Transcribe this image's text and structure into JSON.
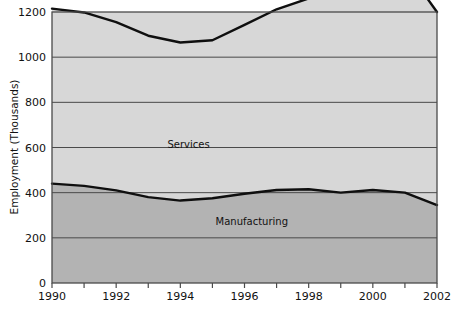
{
  "chart_data": {
    "type": "area",
    "title": "",
    "subtitle": "",
    "xlabel": "",
    "ylabel": "Employment (Thousands)",
    "xlim": [
      1990,
      2002
    ],
    "ylim": [
      0,
      1200
    ],
    "grid": true,
    "grid_axis": "y",
    "legend": "inline-annotations",
    "stacked": true,
    "x": [
      1990,
      1991,
      1992,
      1993,
      1994,
      1995,
      1996,
      1997,
      1998,
      1999,
      2000,
      2001,
      2002
    ],
    "x_tick_labels": [
      "1990",
      "1992",
      "1994",
      "1996",
      "1998",
      "2000",
      "2002"
    ],
    "x_tick_values": [
      1990,
      1992,
      1994,
      1996,
      1998,
      2000,
      2002
    ],
    "x_minor_tick_values": [
      1990,
      1991,
      1992,
      1993,
      1994,
      1995,
      1996,
      1997,
      1998,
      1999,
      2000,
      2001,
      2002
    ],
    "y_tick_labels": [
      "0",
      "200",
      "400",
      "600",
      "800",
      "1000",
      "1200"
    ],
    "y_tick_values": [
      0,
      200,
      400,
      600,
      800,
      1000,
      1200
    ],
    "series": [
      {
        "name": "Manufacturing",
        "label": "Manufacturing",
        "label_x": 1995.1,
        "label_y": 255,
        "fill": "#b3b3b3",
        "line": "#0f0f0f",
        "values": [
          440,
          430,
          410,
          380,
          365,
          375,
          395,
          412,
          415,
          400,
          412,
          400,
          345
        ]
      },
      {
        "name": "Services",
        "label": "Services",
        "label_x": 1993.6,
        "label_y": 600,
        "fill": "#d7d7d7",
        "line": "#0f0f0f",
        "values": [
          775,
          768,
          745,
          715,
          700,
          700,
          748,
          800,
          845,
          880,
          1000,
          998,
          855
        ]
      }
    ],
    "annotations": [
      {
        "text": "Services",
        "kind": "series-inline-label"
      },
      {
        "text": "Manufacturing",
        "kind": "series-inline-label"
      }
    ]
  },
  "colors": {
    "plot_background": "#d7d7d7",
    "services_band": "#d7d7d7",
    "manufacturing_band": "#b3b3b3",
    "line": "#0f0f0f",
    "grid": "#4a4a4a",
    "frame": "#4a4a4a",
    "text": "#111111",
    "page_background": "#ffffff"
  }
}
